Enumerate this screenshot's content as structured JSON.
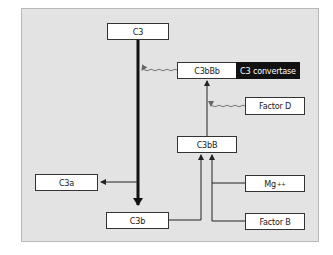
{
  "diagram": {
    "colors": {
      "panel_bg": "#e3e3e3",
      "box_bg": "#ffffff",
      "highlight_bg": "#111111",
      "line": "#222222"
    },
    "nodes": {
      "c3": "C3",
      "c3bbb": "C3bBb",
      "convertase_label": "C3 convertase",
      "factor_d": "Factor D",
      "c3bb": "C3bB",
      "c3a": "C3a",
      "mg_base": "Mg",
      "mg_sup": "++",
      "c3b": "C3b",
      "factor_b": "Factor B"
    },
    "edges": [
      {
        "from": "C3",
        "to": "C3b",
        "style": "thick"
      },
      {
        "from": "C3 (cleavage)",
        "to": "C3a",
        "style": "thin"
      },
      {
        "from": "C3bBb",
        "to": "C3 cleavage",
        "style": "wavy"
      },
      {
        "from": "C3bB",
        "to": "C3bBb",
        "style": "thin"
      },
      {
        "from": "Factor D",
        "to": "C3bB→C3bBb",
        "style": "wavy"
      },
      {
        "from": "C3b",
        "to": "C3bB",
        "style": "thin"
      },
      {
        "from": "Mg++",
        "to": "C3bB",
        "style": "thin"
      },
      {
        "from": "Factor B",
        "to": "C3bB",
        "style": "thin"
      }
    ]
  }
}
